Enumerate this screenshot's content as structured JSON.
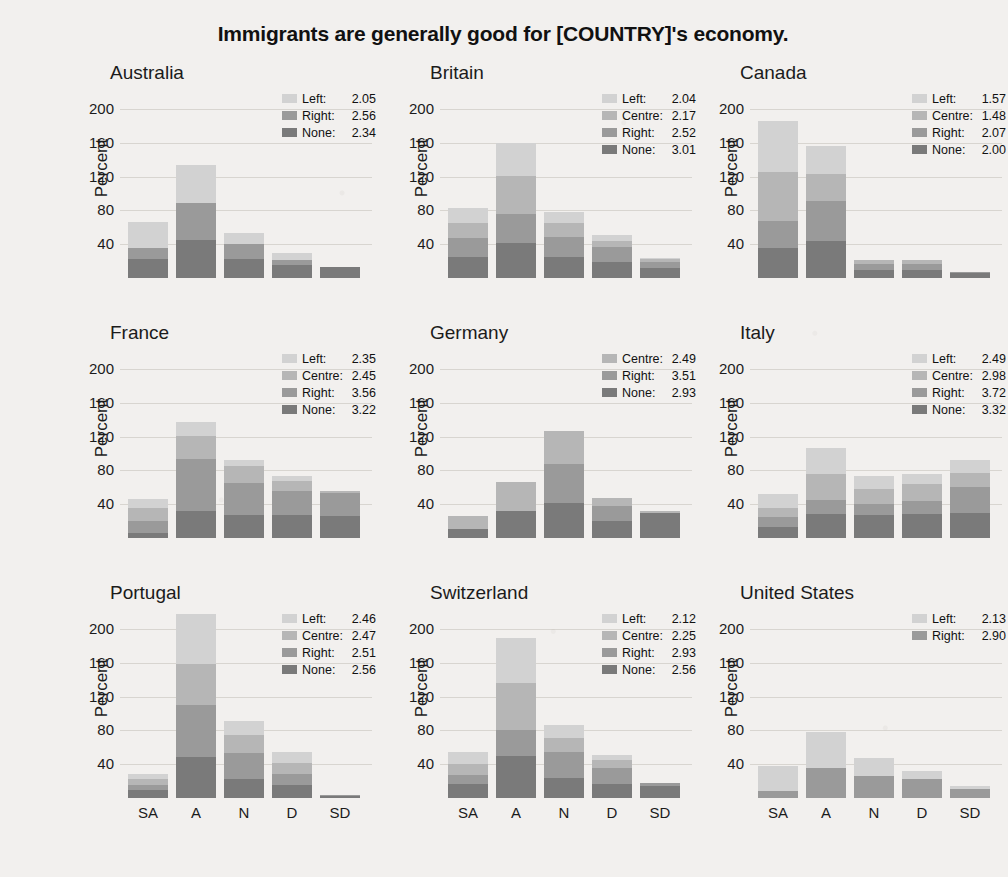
{
  "chart_data": {
    "type": "bar",
    "title": "Immigrants are generally good for [COUNTRY]'s economy.",
    "subplot_layout": [
      3,
      3
    ],
    "categories": [
      "SA",
      "A",
      "N",
      "D",
      "SD"
    ],
    "xlabel": "",
    "ylabel": "Percent",
    "yticks": [
      40,
      80,
      120,
      160,
      200
    ],
    "ylim": [
      0,
      225
    ],
    "grid": true,
    "stacked": true,
    "legend_position": "top-right inside panel",
    "series_order": [
      "None",
      "Right",
      "Centre",
      "Left"
    ],
    "series_colors": {
      "None": "#7a7a7a",
      "Right": "#9a9a9a",
      "Centre": "#b6b6b6",
      "Left": "#d2d2d2"
    },
    "panels": [
      {
        "name": "Australia",
        "legend": [
          {
            "label": "Left",
            "value": "2.05",
            "key": "left"
          },
          {
            "label": "Right",
            "value": "2.56",
            "key": "right"
          },
          {
            "label": "None",
            "value": "2.34",
            "key": "none"
          }
        ],
        "series": [
          {
            "name": "None",
            "key": "none",
            "values": [
              22,
              45,
              23,
              16,
              13
            ]
          },
          {
            "name": "Right",
            "key": "right",
            "values": [
              14,
              44,
              17,
              5,
              0
            ]
          },
          {
            "name": "Centre",
            "key": "centre",
            "values": [
              0,
              0,
              0,
              0,
              0
            ]
          },
          {
            "name": "Left",
            "key": "left",
            "values": [
              30,
              45,
              13,
              9,
              0
            ]
          }
        ],
        "totals": [
          66,
          134,
          53,
          30,
          13
        ]
      },
      {
        "name": "Britain",
        "legend": [
          {
            "label": "Left",
            "value": "2.04",
            "key": "left"
          },
          {
            "label": "Centre",
            "value": "2.17",
            "key": "centre"
          },
          {
            "label": "Right",
            "value": "2.52",
            "key": "right"
          },
          {
            "label": "None",
            "value": "3.01",
            "key": "none"
          }
        ],
        "series": [
          {
            "name": "None",
            "key": "none",
            "values": [
              25,
              42,
              25,
              19,
              12
            ]
          },
          {
            "name": "Right",
            "key": "right",
            "values": [
              22,
              34,
              23,
              18,
              7
            ]
          },
          {
            "name": "Centre",
            "key": "centre",
            "values": [
              18,
              45,
              17,
              7,
              3
            ]
          },
          {
            "name": "Left",
            "key": "left",
            "values": [
              18,
              39,
              13,
              7,
              2
            ]
          }
        ],
        "totals": [
          83,
          160,
          78,
          51,
          24
        ]
      },
      {
        "name": "Canada",
        "legend": [
          {
            "label": "Left",
            "value": "1.57",
            "key": "left"
          },
          {
            "label": "Centre",
            "value": "1.48",
            "key": "centre"
          },
          {
            "label": "Right",
            "value": "2.07",
            "key": "right"
          },
          {
            "label": "None",
            "value": "2.00",
            "key": "none"
          }
        ],
        "series": [
          {
            "name": "None",
            "key": "none",
            "values": [
              35,
              44,
              10,
              10,
              6
            ]
          },
          {
            "name": "Right",
            "key": "right",
            "values": [
              33,
              47,
              7,
              7,
              1
            ]
          },
          {
            "name": "Centre",
            "key": "centre",
            "values": [
              58,
              32,
              4,
              4,
              0
            ]
          },
          {
            "name": "Left",
            "key": "left",
            "values": [
              60,
              33,
              0,
              0,
              0
            ]
          }
        ],
        "totals": [
          186,
          156,
          21,
          21,
          7
        ]
      },
      {
        "name": "France",
        "legend": [
          {
            "label": "Left",
            "value": "2.35",
            "key": "left"
          },
          {
            "label": "Centre",
            "value": "2.45",
            "key": "centre"
          },
          {
            "label": "Right",
            "value": "3.56",
            "key": "right"
          },
          {
            "label": "None",
            "value": "3.22",
            "key": "none"
          }
        ],
        "series": [
          {
            "name": "None",
            "key": "none",
            "values": [
              6,
              32,
              27,
              27,
              26
            ]
          },
          {
            "name": "Right",
            "key": "right",
            "values": [
              14,
              62,
              38,
              29,
              27
            ]
          },
          {
            "name": "Centre",
            "key": "centre",
            "values": [
              15,
              27,
              20,
              11,
              3
            ]
          },
          {
            "name": "Left",
            "key": "left",
            "values": [
              11,
              17,
              7,
              6,
              0
            ]
          }
        ],
        "totals": [
          46,
          138,
          92,
          73,
          56
        ]
      },
      {
        "name": "Germany",
        "legend": [
          {
            "label": "Centre",
            "value": "2.49",
            "key": "centre"
          },
          {
            "label": "Right",
            "value": "3.51",
            "key": "right"
          },
          {
            "label": "None",
            "value": "2.93",
            "key": "none"
          }
        ],
        "series": [
          {
            "name": "None",
            "key": "none",
            "values": [
              11,
              32,
              42,
              20,
              30
            ]
          },
          {
            "name": "Right",
            "key": "right",
            "values": [
              0,
              0,
              46,
              18,
              0
            ]
          },
          {
            "name": "Centre",
            "key": "centre",
            "values": [
              15,
              34,
              39,
              10,
              2
            ]
          },
          {
            "name": "Left",
            "key": "left",
            "values": [
              0,
              0,
              0,
              0,
              0
            ]
          }
        ],
        "totals": [
          26,
          66,
          127,
          48,
          32
        ]
      },
      {
        "name": "Italy",
        "legend": [
          {
            "label": "Left",
            "value": "2.49",
            "key": "left"
          },
          {
            "label": "Centre",
            "value": "2.98",
            "key": "centre"
          },
          {
            "label": "Right",
            "value": "3.72",
            "key": "right"
          },
          {
            "label": "None",
            "value": "3.32",
            "key": "none"
          }
        ],
        "series": [
          {
            "name": "None",
            "key": "none",
            "values": [
              13,
              28,
              27,
              28,
              30
            ]
          },
          {
            "name": "Right",
            "key": "right",
            "values": [
              12,
              17,
              13,
              16,
              30
            ]
          },
          {
            "name": "Centre",
            "key": "centre",
            "values": [
              10,
              31,
              18,
              20,
              17
            ]
          },
          {
            "name": "Left",
            "key": "left",
            "values": [
              17,
              31,
              16,
              12,
              15
            ]
          }
        ],
        "totals": [
          52,
          107,
          74,
          76,
          92
        ]
      },
      {
        "name": "Portugal",
        "legend": [
          {
            "label": "Left",
            "value": "2.46",
            "key": "left"
          },
          {
            "label": "Centre",
            "value": "2.47",
            "key": "centre"
          },
          {
            "label": "Right",
            "value": "2.51",
            "key": "right"
          },
          {
            "label": "None",
            "value": "2.56",
            "key": "none"
          }
        ],
        "series": [
          {
            "name": "None",
            "key": "none",
            "values": [
              9,
              48,
              23,
              16,
              2
            ]
          },
          {
            "name": "Right",
            "key": "right",
            "values": [
              6,
              62,
              30,
              12,
              1
            ]
          },
          {
            "name": "Centre",
            "key": "centre",
            "values": [
              8,
              49,
              22,
              14,
              0
            ]
          },
          {
            "name": "Left",
            "key": "left",
            "values": [
              6,
              59,
              16,
              13,
              0
            ]
          }
        ],
        "totals": [
          29,
          218,
          91,
          55,
          3
        ]
      },
      {
        "name": "Switzerland",
        "legend": [
          {
            "label": "Left",
            "value": "2.12",
            "key": "left"
          },
          {
            "label": "Centre",
            "value": "2.25",
            "key": "centre"
          },
          {
            "label": "Right",
            "value": "2.93",
            "key": "right"
          },
          {
            "label": "None",
            "value": "2.56",
            "key": "none"
          }
        ],
        "series": [
          {
            "name": "None",
            "key": "none",
            "values": [
              17,
              50,
              24,
              17,
              14
            ]
          },
          {
            "name": "Right",
            "key": "right",
            "values": [
              10,
              31,
              30,
              19,
              4
            ]
          },
          {
            "name": "Centre",
            "key": "centre",
            "values": [
              13,
              55,
              17,
              9,
              0
            ]
          },
          {
            "name": "Left",
            "key": "left",
            "values": [
              14,
              54,
              16,
              6,
              0
            ]
          }
        ],
        "totals": [
          54,
          190,
          87,
          51,
          18
        ]
      },
      {
        "name": "United States",
        "legend": [
          {
            "label": "Left",
            "value": "2.13",
            "key": "left"
          },
          {
            "label": "Right",
            "value": "2.90",
            "key": "right"
          }
        ],
        "series": [
          {
            "name": "None",
            "key": "none",
            "values": [
              0,
              0,
              0,
              0,
              0
            ]
          },
          {
            "name": "Right",
            "key": "right",
            "values": [
              8,
              35,
              26,
              22,
              11
            ]
          },
          {
            "name": "Centre",
            "key": "centre",
            "values": [
              0,
              0,
              0,
              0,
              0
            ]
          },
          {
            "name": "Left",
            "key": "left",
            "values": [
              30,
              43,
              21,
              10,
              3
            ]
          }
        ],
        "totals": [
          38,
          78,
          47,
          32,
          14
        ]
      }
    ]
  }
}
